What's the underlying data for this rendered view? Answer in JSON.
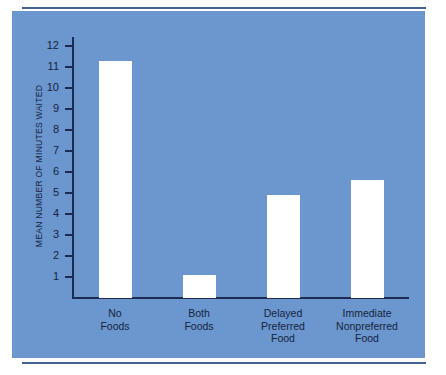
{
  "chart_data": {
    "type": "bar",
    "title": "",
    "subtitle": "",
    "xlabel": "",
    "ylabel": "MEAN NUMBER OF MINUTES WAITED",
    "categories": [
      "No\nFoods",
      "Both\nFoods",
      "Delayed\nPreferred\nFood",
      "Immediate\nNonpreferred\nFood"
    ],
    "values": [
      11.3,
      1.1,
      4.9,
      5.6
    ],
    "ylim": [
      0,
      12
    ],
    "yticks": [
      12,
      11,
      10,
      9,
      8,
      7,
      6,
      5,
      4,
      3,
      2,
      1
    ],
    "ytick_labels": [
      "12",
      "11",
      "10",
      "9",
      "8",
      "7",
      "6",
      "5",
      "4",
      "3",
      "2",
      "1"
    ],
    "grid": false,
    "legend": false,
    "bar_color": "#ffffff",
    "background_color": "#6b96ce",
    "axis_color": "#1b2c54",
    "text_color": "#152440"
  }
}
